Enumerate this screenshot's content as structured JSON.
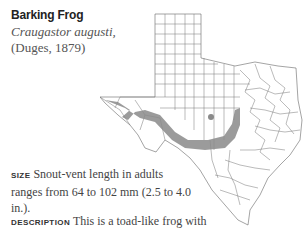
{
  "species": {
    "common_name": "Barking Frog",
    "scientific_name": "Craugastor augusti,",
    "authority": "(Duges, 1879)"
  },
  "map": {
    "region": "Texas",
    "range_color": "#8a8a8a",
    "county_line_color": "#555555"
  },
  "sections": [
    {
      "label": "SIZE",
      "text": "Snout-vent length in adults ranges from 64 to 102 mm (2.5 to 4.0 in.)."
    },
    {
      "label": "DESCRIPTION",
      "text": "This is a toad-like frog with"
    },
    {
      "partial_text": "a relatively large, smooth, ... skin ..."
    }
  ]
}
